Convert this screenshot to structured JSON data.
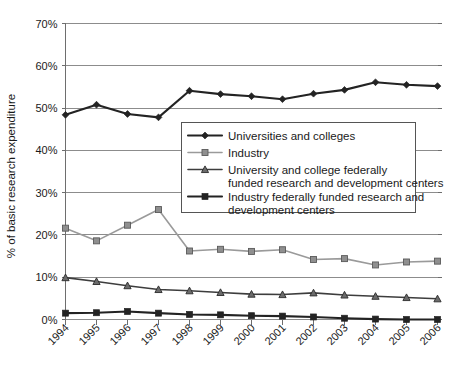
{
  "chart_data": {
    "type": "line",
    "title": "",
    "xlabel": "",
    "ylabel": "% of basic research expenditure",
    "ylim": [
      0,
      70
    ],
    "ytick_labels": [
      "0%",
      "10%",
      "20%",
      "30%",
      "40%",
      "50%",
      "60%",
      "70%"
    ],
    "ytick_values": [
      0,
      10,
      20,
      30,
      40,
      50,
      60,
      70
    ],
    "grid": true,
    "legend_position": "center-right-inside",
    "categories": [
      "1994",
      "1995",
      "1996",
      "1997",
      "1998",
      "1999",
      "2000",
      "2001",
      "2002",
      "2003",
      "2004",
      "2005",
      "2006"
    ],
    "series": [
      {
        "name": "Universities and colleges",
        "marker": "diamond",
        "color": "#232323",
        "values": [
          48.4,
          50.8,
          48.6,
          47.8,
          54.1,
          53.3,
          52.8,
          52.1,
          53.4,
          54.3,
          56.1,
          55.5,
          55.2
        ]
      },
      {
        "name": "Industry",
        "marker": "square",
        "color": "#8f8f8f",
        "values": [
          21.6,
          18.6,
          22.3,
          26.0,
          16.2,
          16.6,
          16.1,
          16.5,
          14.2,
          14.4,
          12.9,
          13.6,
          13.8
        ]
      },
      {
        "name": "University and college federally funded research and development centers",
        "marker": "triangle",
        "color": "#6b6b6b",
        "values": [
          9.9,
          9.0,
          8.0,
          7.1,
          6.8,
          6.4,
          6.0,
          5.9,
          6.3,
          5.8,
          5.5,
          5.2,
          4.9
        ]
      },
      {
        "name": "Industry federally funded research and development centers",
        "marker": "square",
        "color": "#232323",
        "values": [
          1.5,
          1.6,
          1.9,
          1.5,
          1.2,
          1.1,
          0.9,
          0.8,
          0.6,
          0.3,
          0.1,
          0.0,
          0.0
        ]
      }
    ]
  },
  "axis": {
    "y_title": "% of basic research expenditure"
  },
  "legend": {
    "items": [
      {
        "label": "Universities and colleges",
        "label2": ""
      },
      {
        "label": "Industry",
        "label2": ""
      },
      {
        "label": "University and college federally",
        "label2": "funded research and development centers"
      },
      {
        "label": "Industry federally funded research and",
        "label2": "development centers"
      }
    ]
  }
}
